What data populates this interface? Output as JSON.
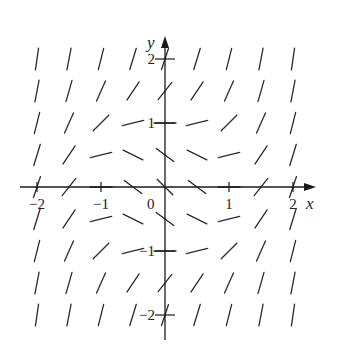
{
  "figure": {
    "type": "slope-field",
    "x_label": "x",
    "y_label": "y",
    "origin_label": "0",
    "x_ticks": [
      {
        "value": -2,
        "label": "−2"
      },
      {
        "value": -1,
        "label": "−1"
      },
      {
        "value": 1,
        "label": "1"
      },
      {
        "value": 2,
        "label": "2"
      }
    ],
    "y_ticks": [
      {
        "value": 2,
        "label": "2"
      },
      {
        "value": 1,
        "label": "1"
      },
      {
        "value": -1,
        "label": "−1"
      },
      {
        "value": -2,
        "label": "−2"
      }
    ],
    "grid": {
      "x_values": [
        -2,
        -1.5,
        -1,
        -0.5,
        0,
        0.5,
        1,
        1.5,
        2
      ],
      "y_values": [
        2,
        1.5,
        1,
        0.5,
        0,
        -0.5,
        -1,
        -1.5,
        -2
      ]
    },
    "slope_rule": "x^2 + y^2 - 1",
    "colors": {
      "ink": "#2a2a2a",
      "background": "#ffffff"
    }
  },
  "layout": {
    "origin_px": [
      165,
      187
    ],
    "unit_px": 64,
    "segment_len_px": 22,
    "x_axis_px": [
      20,
      316
    ],
    "y_axis_px": [
      36,
      340
    ]
  }
}
